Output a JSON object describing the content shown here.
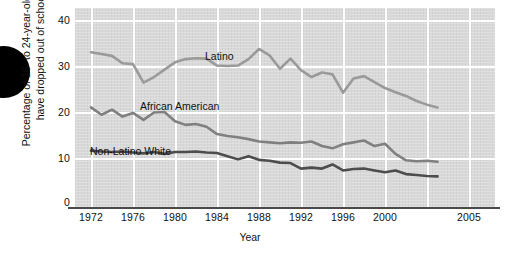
{
  "chart_data": {
    "type": "line",
    "title": "",
    "xlabel": "Year",
    "ylabel": "Percentage of 16- to 24-year-olds who have dropped out of school",
    "ylabel_line1": "Percentage of 16- to 24-year-olds who",
    "ylabel_line2": "have dropped out of school",
    "xlim": [
      1972,
      2005
    ],
    "ylim": [
      0,
      40
    ],
    "ytick_labels": [
      "0",
      "10",
      "20",
      "30",
      "40"
    ],
    "yticks": [
      0,
      10,
      20,
      30,
      40
    ],
    "xtick_labels": [
      "1972",
      "1976",
      "1980",
      "1984",
      "1988",
      "1992",
      "1996",
      "2000",
      "2005"
    ],
    "xticks": [
      1972,
      1976,
      1980,
      1984,
      1988,
      1992,
      1996,
      2000,
      2005
    ],
    "grid": true,
    "legend_position": "inline-labels",
    "x": [
      1972,
      1973,
      1974,
      1975,
      1976,
      1977,
      1978,
      1979,
      1980,
      1981,
      1982,
      1983,
      1984,
      1985,
      1986,
      1987,
      1988,
      1989,
      1990,
      1991,
      1992,
      1993,
      1994,
      1995,
      1996,
      1997,
      1998,
      1999,
      2000,
      2001,
      2002,
      2003,
      2004,
      2005
    ],
    "series": [
      {
        "name": "Latino",
        "color": "#9a9a9a",
        "values": [
          33.0,
          32.6,
          32.2,
          30.6,
          30.4,
          26.4,
          27.6,
          29.2,
          30.8,
          31.5,
          31.7,
          31.6,
          30.1,
          30.0,
          30.1,
          31.5,
          33.7,
          32.3,
          29.4,
          31.6,
          29.1,
          27.6,
          28.6,
          28.2,
          24.2,
          27.3,
          27.8,
          26.5,
          25.2,
          24.3,
          23.5,
          22.4,
          21.6,
          21.0
        ]
      },
      {
        "name": "African American",
        "color": "#808080",
        "values": [
          21.0,
          19.4,
          20.5,
          19.0,
          19.8,
          18.3,
          19.9,
          20.0,
          18.0,
          17.2,
          17.4,
          16.8,
          15.2,
          14.8,
          14.5,
          14.1,
          13.6,
          13.4,
          13.2,
          13.4,
          13.3,
          13.6,
          12.6,
          12.1,
          13.0,
          13.4,
          13.8,
          12.6,
          13.1,
          10.9,
          9.5,
          9.3,
          9.4,
          9.2
        ]
      },
      {
        "name": "Non-Latino White",
        "color": "#4d4d4d",
        "values": [
          11.6,
          11.4,
          11.3,
          11.4,
          11.2,
          11.0,
          11.3,
          10.9,
          11.3,
          11.3,
          11.4,
          11.2,
          11.1,
          10.4,
          9.7,
          10.4,
          9.6,
          9.4,
          9.0,
          8.9,
          7.7,
          7.9,
          7.7,
          8.6,
          7.3,
          7.6,
          7.7,
          7.3,
          6.9,
          7.3,
          6.5,
          6.3,
          6.1,
          6.0
        ]
      }
    ]
  },
  "chart": {
    "series_labels": {
      "latino": "Latino",
      "african_american": "African American",
      "non_latino_white": "Non-Latino White"
    },
    "x_axis_title": "Year",
    "y_axis_title_line1": "Percentage of 16- to 24-year-olds who",
    "y_axis_title_line2": "have dropped out of school",
    "y_ticks": [
      "40",
      "30",
      "20",
      "10",
      "0"
    ],
    "x_ticks": [
      "1972",
      "1976",
      "1980",
      "1984",
      "1988",
      "1992",
      "1996",
      "2000",
      "2005"
    ],
    "colors": {
      "plot_background": "#d9d9d9",
      "gridline": "#ffffff",
      "latino": "#9a9a9a",
      "african_american": "#808080",
      "non_latino_white": "#4d4d4d",
      "axis": "#4a4a4a"
    }
  }
}
